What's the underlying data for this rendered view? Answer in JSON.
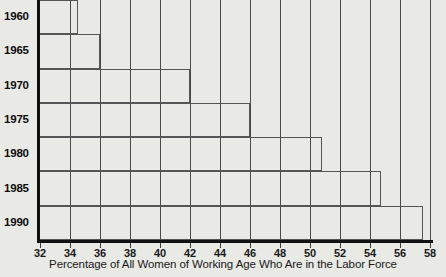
{
  "chart_data": {
    "type": "bar",
    "orientation": "horizontal",
    "title": "",
    "xlabel": "Percentage of All Women of Working Age Who Are in the Labor Force",
    "ylabel": "",
    "categories": [
      "1960",
      "1965",
      "1970",
      "1975",
      "1980",
      "1985",
      "1990"
    ],
    "values": [
      34.5,
      36.0,
      42.0,
      46.0,
      50.8,
      54.7,
      57.5
    ],
    "xlim": [
      32,
      58
    ],
    "xticks": [
      32,
      34,
      36,
      38,
      40,
      42,
      44,
      46,
      48,
      50,
      52,
      54,
      56,
      58
    ],
    "xticklabels": [
      "32",
      "34",
      "36",
      "38",
      "40",
      "42",
      "44",
      "46",
      "48",
      "50",
      "52",
      "54",
      "56",
      "58"
    ],
    "grid": "vertical",
    "legend": "none",
    "bar_style": "outline",
    "colors": {
      "background": "#e9e9e6",
      "axis": "#111111",
      "gridline": "#4a4a4a",
      "bar_outline": "#555555",
      "text": "#1a1a1a"
    }
  }
}
